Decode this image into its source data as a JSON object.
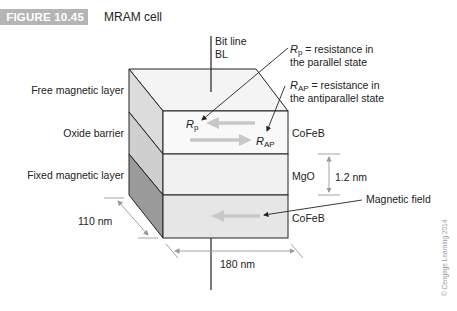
{
  "figure": {
    "number_label": "FIGURE 10.45",
    "title": "MRAM cell"
  },
  "bit_line": {
    "line1": "Bit line",
    "line2": "BL"
  },
  "left_labels": {
    "free_layer": "Free magnetic layer",
    "oxide_barrier": "Oxide barrier",
    "fixed_layer": "Fixed magnetic layer"
  },
  "right_labels": {
    "top_material": "CoFeB",
    "middle_material": "MgO",
    "bottom_material": "CoFeB",
    "magnetic_field": "Magnetic field"
  },
  "legend": {
    "rp_symbol": "R",
    "rp_sub": "p",
    "rp_desc_line1": " = resistance in",
    "rp_desc_line2": "the parallel state",
    "rap_symbol": "R",
    "rap_sub": "AP",
    "rap_desc_line1": " = resistance in",
    "rap_desc_line2": "the antiparallel state"
  },
  "in_cell_labels": {
    "rp_symbol": "R",
    "rp_sub": "p",
    "rap_symbol": "R",
    "rap_sub": "AP"
  },
  "dimensions": {
    "depth": "110 nm",
    "width": "180 nm",
    "barrier_thickness": "1.2 nm"
  },
  "copyright": "© Cengage Learning 2014",
  "colors": {
    "label_box": "#b5b5b5",
    "top_face": "#f4f4f4",
    "front_free": "#f9f9f9",
    "front_oxide": "#f1f1f1",
    "front_fixed": "#e6e6e6",
    "side_free": "#dcdcdc",
    "side_oxide": "#cfcfcf",
    "side_fixed": "#9a9a9a",
    "arrow_grey": "#c8c8c8",
    "dim_line": "#999999"
  }
}
